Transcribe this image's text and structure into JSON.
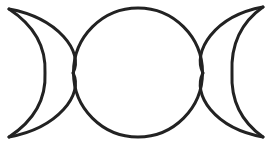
{
  "symbol": {
    "name": "Triple Moon",
    "description": "Waxing crescent, full moon, waning crescent",
    "stroke_color": "#222222",
    "background_color": "#ffffff",
    "stroke_width": 3,
    "full_moon": {
      "cx": 138,
      "cy": 72.5,
      "r": 64.5
    },
    "left_crescent": {
      "path": "M 9 9 A 70 70 0 0 1 9 137 A 96 96 0 0 0 9 9 Z",
      "outer_path": "M 9 9 Q 120 40 73 73 Q 120 106 9 137",
      "inner_path": "M 9 9 Q 70 50 44 73 Q 70 96 9 137"
    },
    "right_crescent": {
      "outer_path": "M 263 7 Q 156 40 203 73 Q 156 106 263 137",
      "inner_path": "M 263 7 Q 206 50 232 73 Q 206 96 263 137"
    }
  }
}
